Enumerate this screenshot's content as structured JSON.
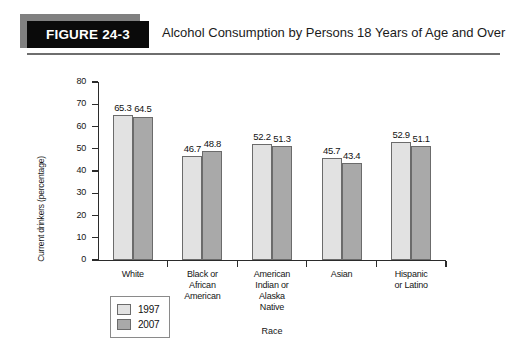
{
  "header": {
    "badge": "FIGURE 24-3",
    "title": "Alcohol Consumption by Persons 18 Years of Age and Over"
  },
  "legend": {
    "entries": [
      {
        "label": "1997",
        "color": "#e2e2e2"
      },
      {
        "label": "2007",
        "color": "#a9a9a9"
      }
    ]
  },
  "chart_data": {
    "type": "bar",
    "title": "Alcohol Consumption by Persons 18 Years of Age and Over",
    "xlabel": "Race",
    "ylabel": "Current drinkers (percentage)",
    "ylim": [
      0,
      80
    ],
    "yticks": [
      0,
      10,
      20,
      30,
      40,
      50,
      60,
      70,
      80
    ],
    "ytick_labels": [
      "0",
      "10",
      "20",
      "30",
      "40",
      "50",
      "60",
      "70",
      "80"
    ],
    "grid": false,
    "legend_position": "below-left",
    "categories": [
      "White",
      "Black or African American",
      "American Indian or Alaska Native",
      "Asian",
      "Hispanic or Latino"
    ],
    "category_lines": [
      [
        "White"
      ],
      [
        "Black or",
        "African",
        "American"
      ],
      [
        "American",
        "Indian or",
        "Alaska",
        "Native"
      ],
      [
        "Asian"
      ],
      [
        "Hispanic",
        "or Latino"
      ]
    ],
    "series": [
      {
        "name": "1997",
        "color": "#e2e2e2",
        "values": [
          65.3,
          46.7,
          52.2,
          45.7,
          52.9
        ],
        "labels": [
          "65.3",
          "46.7",
          "52.2",
          "45.7",
          "52.9"
        ]
      },
      {
        "name": "2007",
        "color": "#a9a9a9",
        "values": [
          64.5,
          48.8,
          51.3,
          43.4,
          51.1
        ],
        "labels": [
          "64.5",
          "48.8",
          "51.3",
          "43.4",
          "51.1"
        ]
      }
    ]
  }
}
